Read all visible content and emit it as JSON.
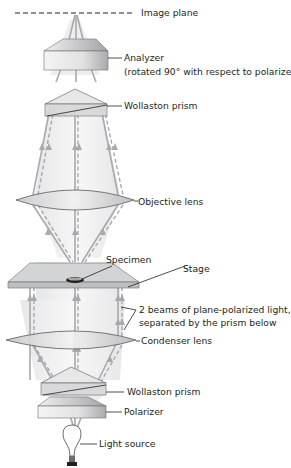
{
  "diagram": {
    "labels": {
      "image_plane": "Image plane",
      "analyzer": "Analyzer",
      "analyzer_note": "(rotated 90° with respect to polarizer)",
      "wollaston_top": "Wollaston prism",
      "objective": "Objective lens",
      "specimen": "Specimen",
      "stage": "Stage",
      "beams_line1": "2 beams of plane-polarized light,",
      "beams_line2": "separated by the prism below",
      "condenser": "Condenser lens",
      "wollaston_bottom": "Wollaston prism",
      "polarizer": "Polarizer",
      "light_source": "Light source"
    },
    "components_bottom_to_top": [
      "light-source",
      "polarizer",
      "wollaston-prism",
      "condenser-lens",
      "stage-with-specimen",
      "objective-lens",
      "wollaston-prism",
      "analyzer",
      "image-plane"
    ],
    "colors": {
      "beam": "#a7a9ac",
      "beam_fill": "#ededee",
      "component_fill": "#d9d9da",
      "component_edge": "#6d6e70",
      "stage_fill": "#cfd0d1",
      "text": "#231f20"
    }
  }
}
